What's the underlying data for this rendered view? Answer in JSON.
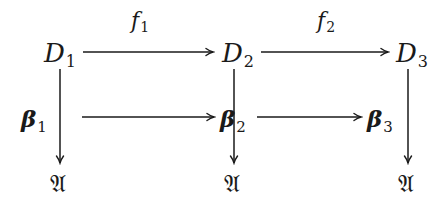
{
  "diagram": {
    "type": "commutative-diagram",
    "nodes": {
      "D1": {
        "symbol": "D",
        "subscript": "1"
      },
      "D2": {
        "symbol": "D",
        "subscript": "2"
      },
      "D3": {
        "symbol": "D",
        "subscript": "3"
      },
      "beta1": {
        "symbol": "β",
        "subscript": "1"
      },
      "beta2": {
        "symbol": "β",
        "subscript": "2"
      },
      "beta3": {
        "symbol": "β",
        "subscript": "3"
      },
      "A1": {
        "symbol": "𝔄"
      },
      "A2": {
        "symbol": "𝔄"
      },
      "A3": {
        "symbol": "𝔄"
      }
    },
    "edge_labels": {
      "f1": {
        "symbol": "f",
        "subscript": "1"
      },
      "f2": {
        "symbol": "f",
        "subscript": "2"
      }
    },
    "edges": [
      {
        "from": "D1",
        "to": "D2",
        "label": "f1",
        "direction": "right"
      },
      {
        "from": "D2",
        "to": "D3",
        "label": "f2",
        "direction": "right"
      },
      {
        "from": "beta1",
        "to": "beta2",
        "label": "",
        "direction": "right"
      },
      {
        "from": "beta2",
        "to": "beta3",
        "label": "",
        "direction": "right"
      },
      {
        "from": "D1",
        "to": "A1",
        "label": "beta1",
        "direction": "down"
      },
      {
        "from": "D2",
        "to": "A2",
        "label": "beta2",
        "direction": "down"
      },
      {
        "from": "D3",
        "to": "A3",
        "label": "beta3",
        "direction": "down"
      }
    ],
    "colors": {
      "ink": "#1a1a1a",
      "background": "#ffffff"
    }
  }
}
